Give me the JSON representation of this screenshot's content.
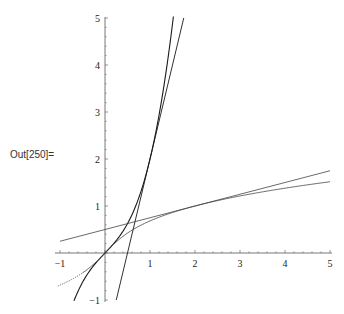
{
  "cell": {
    "output_label": "Out[250]=",
    "truncated_input_text": "...(truncated input line above plot)..."
  },
  "chart_data": {
    "type": "line",
    "title": "",
    "xlabel": "",
    "ylabel": "",
    "xlim": [
      -1,
      5
    ],
    "ylim": [
      -1,
      5
    ],
    "grid": false,
    "legend": null,
    "x_ticks": [
      -1,
      1,
      2,
      3,
      4,
      5
    ],
    "y_ticks": [
      -1,
      1,
      2,
      3,
      4,
      5
    ],
    "x_tick_labels": [
      "-1",
      "1",
      "2",
      "3",
      "4",
      "5"
    ],
    "y_tick_labels": [
      "-1",
      "1",
      "2",
      "3",
      "4",
      "5"
    ],
    "series": [
      {
        "name": "f(x) = x + x^3",
        "style": "solid",
        "x": [
          -0.69,
          -0.5,
          0,
          0.5,
          1,
          1.25,
          1.52
        ],
        "y": [
          -1.02,
          -0.625,
          0,
          0.625,
          2,
          3.2,
          5.0
        ]
      },
      {
        "name": "tangent to f at (1,2): y = 4x - 2",
        "style": "solid",
        "x": [
          0.25,
          1.75
        ],
        "y": [
          -1,
          5
        ]
      },
      {
        "name": "inverse f^-1(x)",
        "style": "solid (dotted for x<-0.5)",
        "x": [
          -1,
          -0.625,
          0,
          0.625,
          2,
          3.2,
          5
        ],
        "y": [
          -0.68,
          -0.5,
          0,
          0.5,
          1,
          1.25,
          1.52
        ]
      },
      {
        "name": "tangent to inverse at (2,1): y = 0.25x + 0.5",
        "style": "solid",
        "x": [
          -1,
          5
        ],
        "y": [
          0.25,
          1.75
        ]
      }
    ]
  },
  "colors": {
    "curve": "#1a1a1a",
    "axis": "#555555",
    "background": "#ffffff"
  }
}
